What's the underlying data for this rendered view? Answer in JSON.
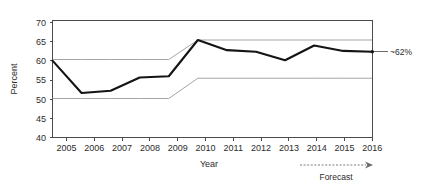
{
  "chart_data": {
    "type": "line",
    "title": "",
    "xlabel": "Year",
    "ylabel": "Percent",
    "xlim": [
      2005,
      2016
    ],
    "ylim": [
      40,
      70
    ],
    "ytick_values": [
      40,
      45,
      50,
      55,
      60,
      65,
      70
    ],
    "ytick_labels": [
      "40",
      "45",
      "50",
      "55",
      "60",
      "65",
      "70"
    ],
    "grid": false,
    "legend_position": "none",
    "categories": [
      2005,
      2006,
      2007,
      2008,
      2009,
      2010,
      2011,
      2012,
      2013,
      2014,
      2015,
      2016
    ],
    "xtick_labels": [
      "2005",
      "2006",
      "2007",
      "2008",
      "2009",
      "2010",
      "2011",
      "2012",
      "2013",
      "2014",
      "2015",
      "2016"
    ],
    "series": [
      {
        "name": "Percent",
        "style": "thick-black",
        "values": [
          59.7,
          51.4,
          52.0,
          55.4,
          55.7,
          65.0,
          62.4,
          62.0,
          59.8,
          63.6,
          62.2,
          62.0
        ]
      },
      {
        "name": "Upper band",
        "style": "thin-gray",
        "values": [
          60.0,
          60.0,
          60.0,
          60.0,
          60.0,
          65.0,
          65.0,
          65.0,
          65.0,
          65.0,
          65.0,
          65.0
        ]
      },
      {
        "name": "Lower band",
        "style": "thin-gray",
        "values": [
          50.0,
          50.0,
          50.0,
          50.0,
          50.0,
          55.2,
          55.2,
          55.2,
          55.2,
          55.2,
          55.2,
          55.2
        ]
      }
    ],
    "annotations": [
      {
        "text": "~62%",
        "attached_to_year": 2016,
        "attached_to_value": 62.0,
        "placement": "right-of-axis"
      },
      {
        "text": "Forecast",
        "placement": "below-axis-right",
        "arrow_from_year": 2014,
        "arrow_to_year": 2016
      }
    ]
  },
  "axes": {
    "y_title": "Percent",
    "x_title": "Year"
  },
  "icons": {
    "forecast_arrow": "arrow-right-icon",
    "end_marker": "data-point-marker"
  }
}
